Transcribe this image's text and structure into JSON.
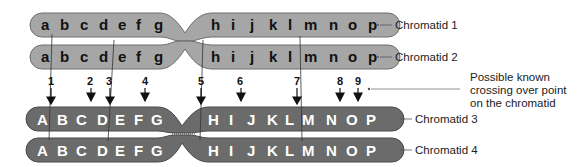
{
  "colors": {
    "light_chromatid": "#a6a6a6",
    "light_outline": "#6e6e6e",
    "dark_chromatid": "#6b6b6b",
    "dark_outline": "#4a4a4a",
    "line": "#333333"
  },
  "chromatids": [
    {
      "label": "Chromatid 1",
      "letters_left": [
        "a",
        "b",
        "c",
        "d",
        "e",
        "f",
        "g"
      ],
      "letters_right": [
        "h",
        "i",
        "j",
        "k",
        "l",
        "m",
        "n",
        "o",
        "p"
      ]
    },
    {
      "label": "Chromatid 2",
      "letters_left": [
        "a",
        "b",
        "c",
        "d",
        "e",
        "f",
        "g"
      ],
      "letters_right": [
        "h",
        "i",
        "j",
        "k",
        "l",
        "m",
        "n",
        "o",
        "p"
      ]
    },
    {
      "label": "Chromatid 3",
      "letters_left": [
        "A",
        "B",
        "C",
        "D",
        "E",
        "F",
        "G"
      ],
      "letters_right": [
        "H",
        "I",
        "J",
        "K",
        "L",
        "M",
        "N",
        "O",
        "P"
      ]
    },
    {
      "label": "Chromatid 4",
      "letters_left": [
        "A",
        "B",
        "C",
        "D",
        "E",
        "F",
        "G"
      ],
      "letters_right": [
        "H",
        "I",
        "J",
        "K",
        "L",
        "M",
        "N",
        "O",
        "P"
      ]
    }
  ],
  "crossover_points": [
    "1",
    "2",
    "3",
    "4",
    "5",
    "6",
    "7",
    "8",
    "9"
  ],
  "annotation": {
    "line1": "Possible known",
    "line2": "crossing over point",
    "line3": "on the chromatid"
  }
}
